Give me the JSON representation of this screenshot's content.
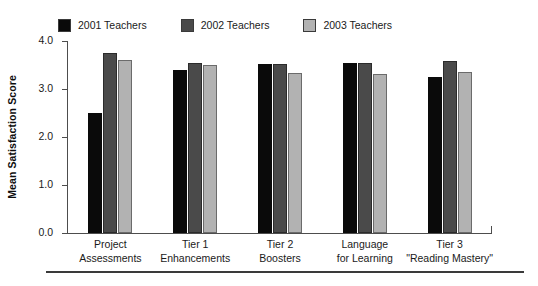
{
  "chart_data": {
    "type": "bar",
    "title": "",
    "xlabel": "",
    "ylabel": "Mean Satisfaction Score",
    "ylim": [
      0.0,
      4.0
    ],
    "yticks": [
      "0.0",
      "1.0",
      "2.0",
      "3.0",
      "4.0"
    ],
    "ytick_values": [
      0.0,
      1.0,
      2.0,
      3.0,
      4.0
    ],
    "grid": false,
    "legend_position": "top",
    "categories": [
      "Project\nAssessments",
      "Tier 1\nEnhancements",
      "Tier 2\nBoosters",
      "Language\nfor Learning",
      "Tier 3\n“Reading Mastery”"
    ],
    "category_lines": [
      [
        "Project",
        "Assessments"
      ],
      [
        "Tier 1",
        "Enhancements"
      ],
      [
        "Tier 2",
        "Boosters"
      ],
      [
        "Language",
        "for Learning"
      ],
      [
        "Tier 3",
        "\"Reading Mastery\""
      ]
    ],
    "series": [
      {
        "name": "2001 Teachers",
        "color": "#0a0a0a",
        "values": [
          2.5,
          3.4,
          3.52,
          3.55,
          3.24
        ]
      },
      {
        "name": "2002 Teachers",
        "color": "#4a4a4a",
        "values": [
          3.75,
          3.55,
          3.52,
          3.55,
          3.58
        ]
      },
      {
        "name": "2003 Teachers",
        "color": "#b2b2b2",
        "values": [
          3.6,
          3.5,
          3.33,
          3.32,
          3.35
        ]
      }
    ]
  },
  "legend": {
    "items": [
      {
        "label": "2001 Teachers",
        "color": "#0a0a0a"
      },
      {
        "label": "2002 Teachers",
        "color": "#4a4a4a"
      },
      {
        "label": "2003 Teachers",
        "color": "#b2b2b2"
      }
    ]
  },
  "axes": {
    "y_title": "Mean Satisfaction Score"
  }
}
